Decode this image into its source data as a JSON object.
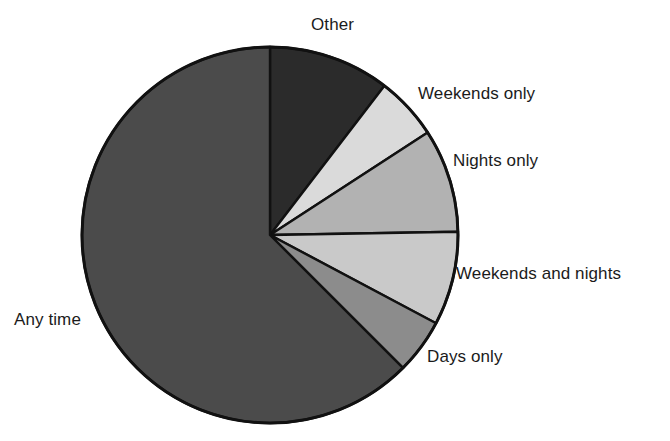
{
  "chart_data": {
    "type": "pie",
    "title": "",
    "subtitle": "",
    "xlabel": "",
    "ylabel": "",
    "grid": false,
    "legend_position": "none",
    "label_placement": "outside-callout",
    "center": {
      "x": 270,
      "y": 235
    },
    "radius": 188,
    "start_angle_deg_from_12oclock": 0,
    "direction": "clockwise",
    "outline_color": "#111111",
    "background_color": "#ffffff",
    "categories": [
      "Other",
      "Weekends only",
      "Nights only",
      "Weekends and nights",
      "Days only",
      "Any time"
    ],
    "values": [
      10.4,
      5.4,
      8.9,
      8.1,
      4.7,
      62.5
    ],
    "units": "percent",
    "slices": [
      {
        "label": "Other",
        "value": 10.4,
        "start_deg": 0,
        "end_deg": 37.5,
        "color": "#2b2b2b"
      },
      {
        "label": "Weekends only",
        "value": 5.4,
        "start_deg": 37.5,
        "end_deg": 57.0,
        "color": "#dadada"
      },
      {
        "label": "Nights only",
        "value": 8.9,
        "start_deg": 57.0,
        "end_deg": 89.0,
        "color": "#b2b2b2"
      },
      {
        "label": "Weekends and nights",
        "value": 8.1,
        "start_deg": 89.0,
        "end_deg": 118.0,
        "color": "#c9c9c9"
      },
      {
        "label": "Days only",
        "value": 4.7,
        "start_deg": 118.0,
        "end_deg": 135.0,
        "color": "#8c8c8c"
      },
      {
        "label": "Any time",
        "value": 62.5,
        "start_deg": 135.0,
        "end_deg": 360.0,
        "color": "#4b4b4b"
      }
    ]
  },
  "labels": {
    "other": "Other",
    "weekends_only": "Weekends only",
    "nights_only": "Nights only",
    "weekends_and_nights": "Weekends and nights",
    "days_only": "Days only",
    "any_time": "Any time"
  }
}
